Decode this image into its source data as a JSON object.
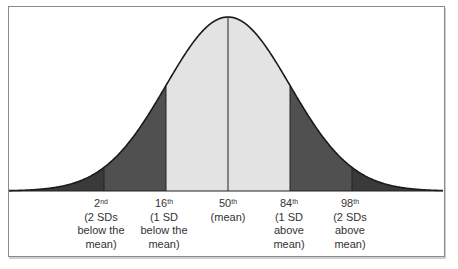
{
  "chart_data": {
    "type": "area",
    "title": "",
    "xlabel": "",
    "ylabel": "",
    "grid": false,
    "colors": {
      "tails_beyond_1sd": "#505050",
      "center_within_1sd": "#e3e3e3",
      "outer_tails_beyond_2sd": "#3a3a3a",
      "curve_stroke": "#1a1a1a"
    },
    "markers": [
      {
        "percentile": "2",
        "suffix": "nd",
        "sd": -2,
        "desc": [
          "(2 SDs",
          "below the",
          "mean)"
        ]
      },
      {
        "percentile": "16",
        "suffix": "th",
        "sd": -1,
        "desc": [
          "(1 SD",
          "below the",
          "mean)"
        ]
      },
      {
        "percentile": "50",
        "suffix": "th",
        "sd": 0,
        "desc": [
          "(mean)"
        ]
      },
      {
        "percentile": "84",
        "suffix": "th",
        "sd": 1,
        "desc": [
          "(1 SD",
          "above",
          "mean)"
        ]
      },
      {
        "percentile": "98",
        "suffix": "th",
        "sd": 2,
        "desc": [
          "(2 SDs",
          "above",
          "mean)"
        ]
      }
    ]
  },
  "labels": {
    "p2": {
      "num": "2",
      "sup": "nd",
      "l1": "(2 SDs",
      "l2": "below the",
      "l3": "mean)"
    },
    "p16": {
      "num": "16",
      "sup": "th",
      "l1": "(1 SD",
      "l2": "below the",
      "l3": "mean)"
    },
    "p50": {
      "num": "50",
      "sup": "th",
      "l1": "(mean)"
    },
    "p84": {
      "num": "84",
      "sup": "th",
      "l1": "(1 SD",
      "l2": "above",
      "l3": "mean)"
    },
    "p98": {
      "num": "98",
      "sup": "th",
      "l1": "(2 SDs",
      "l2": "above",
      "l3": "mean)"
    }
  }
}
